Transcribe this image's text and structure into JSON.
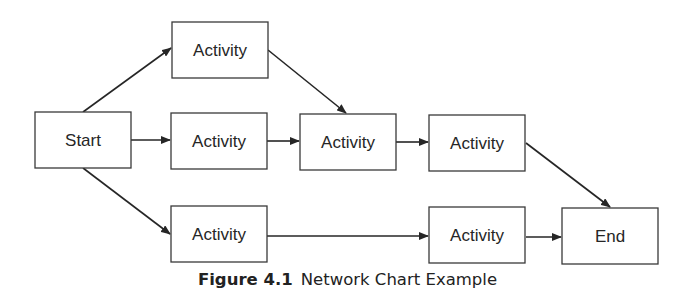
{
  "diagram": {
    "type": "network-chart",
    "nodes": [
      {
        "id": "start",
        "label": "Start"
      },
      {
        "id": "a1",
        "label": "Activity"
      },
      {
        "id": "a2",
        "label": "Activity"
      },
      {
        "id": "a3",
        "label": "Activity"
      },
      {
        "id": "a4",
        "label": "Activity"
      },
      {
        "id": "a5",
        "label": "Activity"
      },
      {
        "id": "a6",
        "label": "Activity"
      },
      {
        "id": "end",
        "label": "End"
      }
    ],
    "edges": [
      {
        "from": "start",
        "to": "a1"
      },
      {
        "from": "start",
        "to": "a2"
      },
      {
        "from": "start",
        "to": "a5"
      },
      {
        "from": "a1",
        "to": "a3"
      },
      {
        "from": "a2",
        "to": "a3"
      },
      {
        "from": "a3",
        "to": "a4"
      },
      {
        "from": "a4",
        "to": "end"
      },
      {
        "from": "a5",
        "to": "a6"
      },
      {
        "from": "a6",
        "to": "end"
      }
    ]
  },
  "caption": {
    "figure_number": "Figure 4.1",
    "title": "Network Chart Example"
  }
}
